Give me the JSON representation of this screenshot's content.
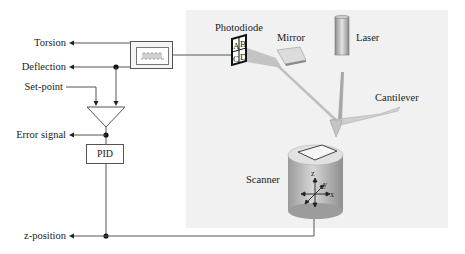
{
  "diagram": {
    "outputs": {
      "torsion": "Torsion",
      "deflection": "Deflection",
      "set_point": "Set-point",
      "error_signal": "Error signal",
      "z_position": "z-position"
    },
    "blocks": {
      "pid": "PID",
      "oscilloscope": "signal-display"
    },
    "components": {
      "photodiode": "Photodiode",
      "mirror": "Mirror",
      "laser": "Laser",
      "cantilever": "Cantilever",
      "scanner": "Scanner"
    },
    "photodiode_quadrants": [
      "A",
      "B",
      "C",
      "D"
    ],
    "scanner_axes": {
      "z": "z",
      "y": "y",
      "x": "x"
    },
    "colors": {
      "line": "#555555",
      "panel_bg": "#f1f1f1",
      "beam": "#b0b0b0",
      "scanner_body": "#b8b8b8"
    }
  }
}
